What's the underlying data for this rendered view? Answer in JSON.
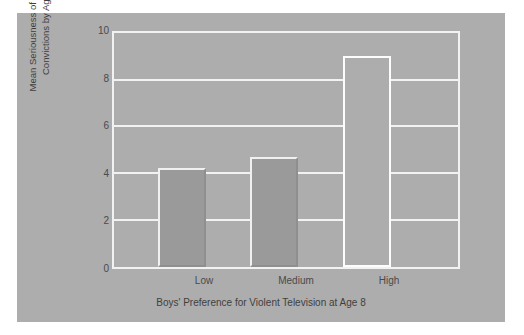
{
  "chart_data": {
    "type": "bar",
    "title": "",
    "xlabel": "Boys' Preference for Violent Television at Age 8",
    "ylabel": "Mean Seriousness of Criminal\nConvictions by Age 30",
    "categories": [
      "Low",
      "Medium",
      "High"
    ],
    "values": [
      4.25,
      4.7,
      9.0
    ],
    "ylim": [
      0,
      10
    ],
    "y_ticks": [
      "0",
      "2",
      "4",
      "6",
      "8",
      "10"
    ],
    "y_tick_values": [
      0,
      2,
      4,
      6,
      8,
      10
    ],
    "grid": true,
    "legend": "none",
    "bar_styles": [
      "filled",
      "filled",
      "hollow"
    ],
    "colors": {
      "page_background": "#ffffff",
      "panel_background": "#adadad",
      "plot_background": "#adadad",
      "gridline": "#f2f2f2",
      "bar_fill": "#9a9a9a",
      "bar_highlight": "#f0f0f0",
      "bar_shadow": "#8f8f8f",
      "hollow_bar_outline": "#fdfdfd",
      "text": "#3f3f3f"
    }
  }
}
